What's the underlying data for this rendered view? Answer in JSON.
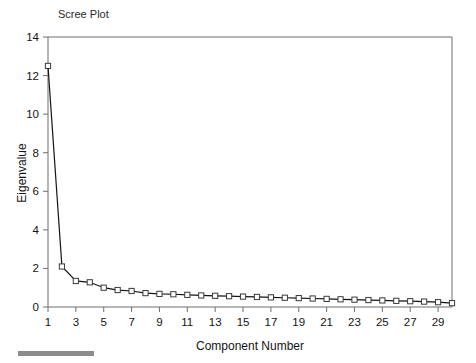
{
  "chart_data": {
    "type": "line",
    "title": "Scree Plot",
    "xlabel": "Component Number",
    "ylabel": "Eigenvalue",
    "x": [
      1,
      2,
      3,
      4,
      5,
      6,
      7,
      8,
      9,
      10,
      11,
      12,
      13,
      14,
      15,
      16,
      17,
      18,
      19,
      20,
      21,
      22,
      23,
      24,
      25,
      26,
      27,
      28,
      29,
      30
    ],
    "values": [
      12.5,
      2.1,
      1.35,
      1.28,
      1.0,
      0.88,
      0.83,
      0.72,
      0.68,
      0.66,
      0.63,
      0.6,
      0.58,
      0.56,
      0.54,
      0.52,
      0.5,
      0.48,
      0.46,
      0.44,
      0.42,
      0.4,
      0.38,
      0.36,
      0.34,
      0.32,
      0.3,
      0.28,
      0.25,
      0.2
    ],
    "xlim": [
      1,
      30
    ],
    "ylim": [
      0,
      14
    ],
    "ytick_labels": [
      "0",
      "2",
      "4",
      "6",
      "8",
      "10",
      "12",
      "14"
    ],
    "ytick_values": [
      0,
      2,
      4,
      6,
      8,
      10,
      12,
      14
    ],
    "xtick_labels": [
      "1",
      "3",
      "5",
      "7",
      "9",
      "11",
      "13",
      "15",
      "17",
      "19",
      "21",
      "23",
      "25",
      "27",
      "29"
    ],
    "xtick_values": [
      1,
      3,
      5,
      7,
      9,
      11,
      13,
      15,
      17,
      19,
      21,
      23,
      25,
      27,
      29
    ],
    "grid": false,
    "legend": false,
    "marker": "open-square",
    "line_color": "#141414",
    "marker_fill": "#ffffff",
    "frame_color": "#6e6e6e",
    "background": "#ffffff"
  }
}
